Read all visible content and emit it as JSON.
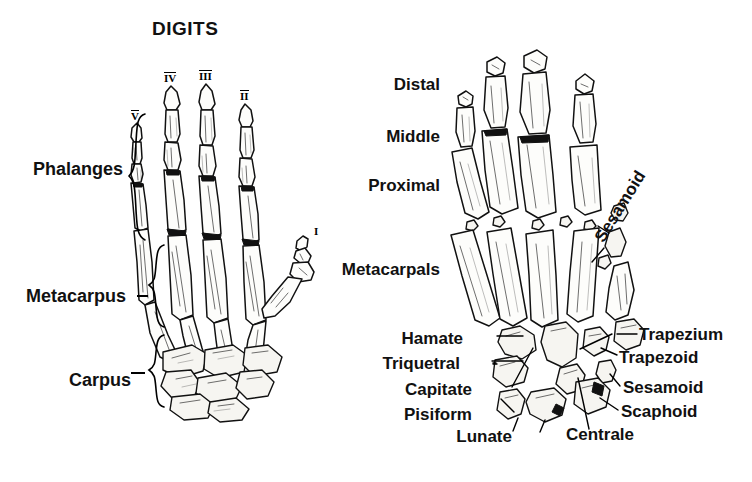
{
  "figure": {
    "title": "DIGITS",
    "kind": "anatomical-line-drawing"
  },
  "left_panel": {
    "name": "digits-hand-skeleton",
    "title": "DIGITS",
    "digit_numerals": [
      {
        "label": "V",
        "overline": true,
        "x": 131,
        "y": 110
      },
      {
        "label": "IV",
        "overline": true,
        "x": 166,
        "y": 72
      },
      {
        "label": "III",
        "overline": true,
        "x": 202,
        "y": 70
      },
      {
        "label": "II",
        "overline": true,
        "x": 241,
        "y": 90
      },
      {
        "label": "I",
        "overline": false,
        "x": 314,
        "y": 226
      }
    ],
    "region_labels": [
      {
        "label": "Phalanges",
        "x": 33,
        "y": 160,
        "brace_x": 128,
        "brace_y": 112,
        "brace_h": 128
      },
      {
        "label": "Metacarpus",
        "x": 26,
        "y": 287,
        "brace_x": 148,
        "brace_y": 243,
        "brace_h": 84
      },
      {
        "label": "Carpus",
        "x": 69,
        "y": 371,
        "brace_x": 148,
        "brace_y": 333,
        "brace_h": 73
      }
    ]
  },
  "right_panel": {
    "name": "bone-labelled-hand-skeleton",
    "row_labels": [
      {
        "label": "Distal",
        "x": 440,
        "y": 76,
        "align": "right"
      },
      {
        "label": "Middle",
        "x": 440,
        "y": 128,
        "align": "right"
      },
      {
        "label": "Proximal",
        "x": 440,
        "y": 177,
        "align": "right"
      },
      {
        "label": "Metacarpals",
        "x": 440,
        "y": 261,
        "align": "right"
      }
    ],
    "rotated_labels": [
      {
        "label": "Sesamoid",
        "x": 606,
        "y": 228,
        "rotation": -58
      }
    ],
    "bone_labels_left": [
      {
        "label": "Hamate",
        "x": 463,
        "y": 339
      },
      {
        "label": "Triquetral",
        "x": 440,
        "y": 364
      },
      {
        "label": "Capitate",
        "x": 452,
        "y": 390
      },
      {
        "label": "Pisiform",
        "x": 452,
        "y": 415
      },
      {
        "label": "Lunate",
        "x": 478,
        "y": 437
      }
    ],
    "bone_labels_right": [
      {
        "label": "Trapezium",
        "x": 619,
        "y": 336
      },
      {
        "label": "Trapezoid",
        "x": 619,
        "y": 359
      },
      {
        "label": "Sesamoid",
        "x": 623,
        "y": 389
      },
      {
        "label": "Scaphoid",
        "x": 621,
        "y": 413
      },
      {
        "label": "Centrale",
        "x": 566,
        "y": 436
      }
    ]
  },
  "colors": {
    "ink": "#111111",
    "paper": "#ffffff",
    "bone_fill": "#fdfdfb",
    "shadow": "#2a2a2a"
  }
}
